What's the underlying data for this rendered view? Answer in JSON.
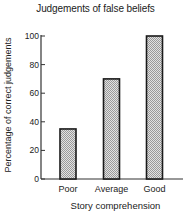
{
  "chart_data": {
    "type": "bar",
    "title": "Judgements of false beliefs",
    "xlabel": "Story comprehension",
    "ylabel": "Percentage of correct judgements",
    "categories": [
      "Poor",
      "Average",
      "Good"
    ],
    "values": [
      35,
      70,
      100
    ],
    "ylim": [
      0,
      100
    ],
    "yticks": [
      0,
      20,
      40,
      60,
      80,
      100
    ],
    "grid": false,
    "legend": null,
    "bar_fill": "stippled gray",
    "bar_outline": "#1a1a1a"
  },
  "colors": {
    "bar_fill": "#c8c8c8",
    "bar_outline": "#1a1a1a",
    "axis": "#333333"
  }
}
